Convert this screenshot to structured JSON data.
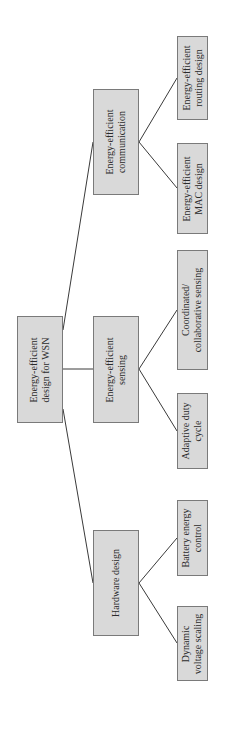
{
  "diagram": {
    "type": "hierarchy-tree",
    "orientation": "rotated-90-ccw",
    "colors": {
      "box_fill": "#d9d9d9",
      "box_border": "#7a7a7a",
      "line": "#3a3a3a",
      "text": "#2b2b2b"
    },
    "root": {
      "label": "Energy-efficient\ndesign for WSN"
    },
    "branches": [
      {
        "label": "Energy-efficient\ncommunication",
        "children": [
          {
            "label": "Energy-efficient\nrouting design"
          },
          {
            "label": "Energy-efficient\nMAC design"
          }
        ]
      },
      {
        "label": "Energy-efficient\nsensing",
        "children": [
          {
            "label": "Coordinated/\ncollaborative sensing"
          },
          {
            "label": "Adaptive duty\ncycle"
          }
        ]
      },
      {
        "label": "Hardware design",
        "children": [
          {
            "label": "Battery energy\ncontrol"
          },
          {
            "label": "Dynamic\nvoltage scaling"
          }
        ]
      }
    ]
  }
}
